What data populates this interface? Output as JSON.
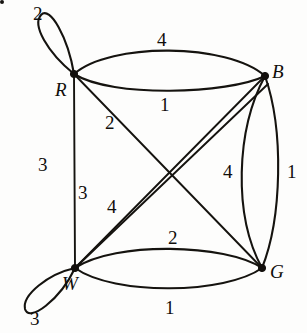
{
  "figure": {
    "type": "weighted-multigraph",
    "background_color": "#fdfdfc",
    "ink_color": "#15130f",
    "width": 307,
    "height": 333
  },
  "vertices": [
    {
      "id": "R",
      "label": "R",
      "x": 74,
      "y": 74,
      "label_x": 55,
      "label_y": 80
    },
    {
      "id": "B",
      "label": "B",
      "x": 265,
      "y": 76,
      "label_x": 272,
      "label_y": 62
    },
    {
      "id": "W",
      "label": "W",
      "x": 75,
      "y": 268,
      "label_x": 62,
      "label_y": 274
    },
    {
      "id": "G",
      "label": "G",
      "x": 262,
      "y": 268,
      "label_x": 270,
      "label_y": 262
    }
  ],
  "edges": [
    {
      "from": "R",
      "to": "R",
      "weight": "2",
      "kind": "self-loop",
      "label_x": 33,
      "label_y": 4
    },
    {
      "from": "R",
      "to": "B",
      "weight": "4",
      "kind": "arc-upper",
      "label_x": 157,
      "label_y": 30
    },
    {
      "from": "R",
      "to": "B",
      "weight": "1",
      "kind": "arc-lower",
      "label_x": 160,
      "label_y": 95
    },
    {
      "from": "R",
      "to": "W",
      "weight": "3",
      "kind": "straight",
      "label_x": 38,
      "label_y": 155
    },
    {
      "from": "R",
      "to": "G",
      "weight": "2",
      "kind": "diagonal",
      "label_x": 105,
      "label_y": 113
    },
    {
      "from": "W",
      "to": "B",
      "weight": "3",
      "kind": "diagonal-outer",
      "label_x": 78,
      "label_y": 183
    },
    {
      "from": "W",
      "to": "B",
      "weight": "4",
      "kind": "diagonal-inner",
      "label_x": 107,
      "label_y": 197
    },
    {
      "from": "B",
      "to": "G",
      "weight": "4",
      "kind": "arc-inner",
      "label_x": 223,
      "label_y": 162
    },
    {
      "from": "B",
      "to": "G",
      "weight": "1",
      "kind": "arc-outer",
      "label_x": 287,
      "label_y": 162
    },
    {
      "from": "W",
      "to": "G",
      "weight": "2",
      "kind": "arc-upper",
      "label_x": 168,
      "label_y": 228
    },
    {
      "from": "W",
      "to": "G",
      "weight": "1",
      "kind": "arc-lower",
      "label_x": 165,
      "label_y": 298
    },
    {
      "from": "W",
      "to": "W",
      "weight": "3",
      "kind": "self-loop",
      "label_x": 30,
      "label_y": 309
    }
  ],
  "marks": [
    {
      "name": "corner-speck",
      "x": 5,
      "y": 20
    }
  ]
}
